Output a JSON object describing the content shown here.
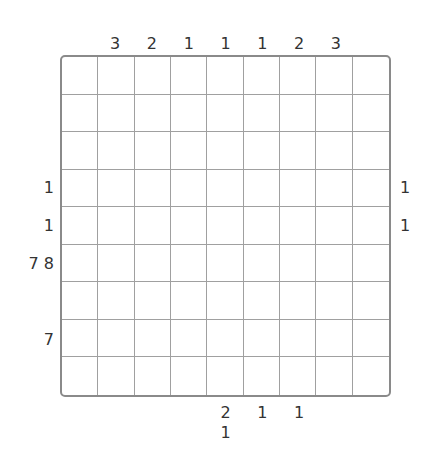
{
  "puzzle": {
    "rows": 9,
    "cols": 9,
    "colors": {
      "grid_line": "#a0a0a0",
      "border": "#8a8a8a",
      "clue_text": "#333333",
      "background": "#ffffff"
    },
    "clues": {
      "top": [
        {
          "col": 2,
          "value": "3"
        },
        {
          "col": 3,
          "value": "2"
        },
        {
          "col": 4,
          "value": "1"
        },
        {
          "col": 5,
          "value": "1"
        },
        {
          "col": 6,
          "value": "1"
        },
        {
          "col": 7,
          "value": "2"
        },
        {
          "col": 8,
          "value": "3"
        }
      ],
      "left": [
        {
          "row": 4,
          "value": "1"
        },
        {
          "row": 5,
          "value": "1"
        },
        {
          "row": 6,
          "value": "7 8"
        },
        {
          "row": 8,
          "value": "7"
        }
      ],
      "right": [
        {
          "row": 4,
          "value": "1"
        },
        {
          "row": 5,
          "value": "1"
        }
      ],
      "bottom": [
        {
          "col": 5,
          "values": [
            "2",
            "1"
          ]
        },
        {
          "col": 6,
          "values": [
            "1"
          ]
        },
        {
          "col": 7,
          "values": [
            "1"
          ]
        }
      ]
    }
  }
}
